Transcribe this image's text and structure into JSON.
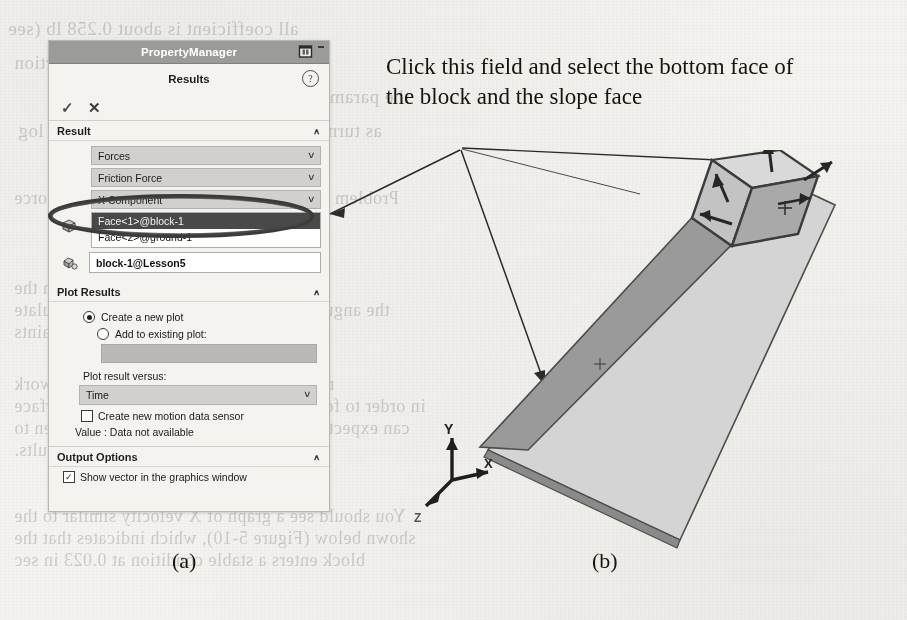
{
  "figure": {
    "caption_a": "(a)",
    "caption_b": "(b)",
    "annotation": "Click this field and select the bottom face of the block and the slope face"
  },
  "property_manager": {
    "window_title": "PropertyManager",
    "pin_icon": "pin-icon",
    "minimize_glyph": "-",
    "header_title": "Results",
    "help_icon": "?",
    "accept_icon": "✓",
    "cancel_icon": "✕",
    "sections": {
      "result": {
        "title": "Result",
        "collapse_chevron": "∧",
        "category_combo": {
          "value": "Forces",
          "arrow": "∨"
        },
        "subcategory_combo": {
          "value": "Friction Force",
          "arrow": "∨"
        },
        "component_combo": {
          "value": "X Component",
          "arrow": "∨"
        },
        "selection_icon": "face-select-icon",
        "selection_list": [
          {
            "label": "Face<1>@block-1",
            "selected": true
          },
          {
            "label": "Face<2>@ground-1",
            "selected": false
          }
        ],
        "component_icon": "component-icon",
        "component_field": "block-1@Lesson5"
      },
      "plot_results": {
        "title": "Plot Results",
        "collapse_chevron": "∧",
        "create_new_plot": "Create a new plot",
        "add_to_existing_plot": "Add to existing plot:",
        "existing_plot_value": "",
        "plot_versus_label": "Plot result versus:",
        "plot_versus_value": "Time",
        "plot_versus_arrow": "∨",
        "create_sensor_label": "Create new motion data sensor",
        "create_sensor_checked": false,
        "value_text": "Value : Data not available"
      },
      "output_options": {
        "title": "Output Options",
        "collapse_chevron": "∧",
        "show_vector_label": "Show vector in the graphics window",
        "show_vector_checked": true,
        "show_vector_check_glyph": "✓"
      }
    }
  },
  "model_view": {
    "triad": {
      "y_label": "Y",
      "x_label": "X",
      "z_label": "Z"
    },
    "parts": [
      "ground-1 slope",
      "block-1",
      "friction force vectors"
    ]
  },
  "colors": {
    "titlebar": "#9a9a99",
    "panel_bg": "#f2f1ee",
    "combo_bg": "#cfcecb",
    "selected_row": "#4a4a4a",
    "paper": "#f4f3f0",
    "ink": "#15140f",
    "model_light": "#d2d2d2",
    "model_mid": "#9d9d9d",
    "model_dark": "#6b6b6b"
  },
  "bleedthrough": [
    {
      "text": "all coefficient is about 0.258 lb (see",
      "x": 8,
      "y": 18,
      "size": 19
    },
    {
      "text": "of the hand force is in the y direction",
      "x": 14,
      "y": 52,
      "size": 19
    },
    {
      "text": "the parameters (for example) by",
      "x": 150,
      "y": 86,
      "size": 19
    },
    {
      "text": "as turned off is the result is the correct in log",
      "x": 18,
      "y": 120,
      "size": 19
    },
    {
      "text": "Problem 5: measure of Drag and Separation Force",
      "x": 14,
      "y": 188,
      "size": 18
    },
    {
      "text": "A number the name  The motion is in the",
      "x": 14,
      "y": 278,
      "size": 18
    },
    {
      "text": "the angular friction coefficient  in  1  and  calculate",
      "x": 14,
      "y": 300,
      "size": 18
    },
    {
      "text": "Solving Constraints",
      "x": 14,
      "y": 322,
      "size": 18
    },
    {
      "text": "motion study named  Analysis  Study  work",
      "x": 14,
      "y": 374,
      "size": 18
    },
    {
      "text": "in order to force on the block, then Change  to surface",
      "x": 14,
      "y": 396,
      "size": 18
    },
    {
      "text": "can expect 2 In the dynamics of three and  Fasten to",
      "x": 14,
      "y": 418,
      "size": 18
    },
    {
      "text": "motion  2  From the analysis results.",
      "x": 14,
      "y": 440,
      "size": 18
    },
    {
      "text": "You should see a graph of X velocity similar to the",
      "x": 14,
      "y": 506,
      "size": 18
    },
    {
      "text": "shown below (Figure 5-10), which indicates that the",
      "x": 14,
      "y": 528,
      "size": 18
    },
    {
      "text": "block enters a stable condition at 0.023 in sec",
      "x": 14,
      "y": 550,
      "size": 18
    }
  ]
}
